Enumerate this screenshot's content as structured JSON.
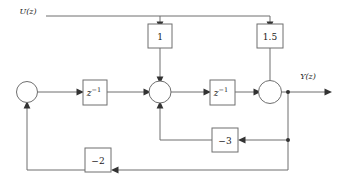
{
  "diagram": {
    "colors": {
      "wire": "#6f6f6f",
      "arrow": "#333333",
      "block_fill": "#ffffff",
      "block_stroke": "#6f6f6f",
      "text": "#1a1a1a",
      "background": "#ffffff"
    },
    "io": {
      "input_label": "U(z)",
      "output_label": "Y(z)"
    },
    "gain_blocks": [
      {
        "name": "gain-1",
        "label": "1"
      },
      {
        "name": "gain-1p5",
        "label": "1.5"
      },
      {
        "name": "gain-minus3",
        "label": "−3"
      },
      {
        "name": "gain-minus2",
        "label": "−2"
      }
    ],
    "delay_blocks": [
      {
        "name": "delay-1",
        "base": "z",
        "exponent": "−1"
      },
      {
        "name": "delay-2",
        "base": "z",
        "exponent": "−1"
      }
    ],
    "summing_junctions": [
      {
        "name": "summing-junction-left"
      },
      {
        "name": "summing-junction-middle"
      },
      {
        "name": "summing-junction-right"
      }
    ]
  }
}
